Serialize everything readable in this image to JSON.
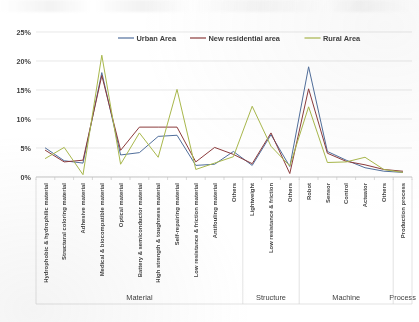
{
  "chart_data": {
    "type": "line",
    "title": "",
    "xlabel": "",
    "ylabel": "",
    "ylim": [
      0,
      25
    ],
    "ytick_labels": [
      "0%",
      "5%",
      "10%",
      "15%",
      "20%",
      "25%"
    ],
    "ytick_values": [
      0,
      5,
      10,
      15,
      20,
      25
    ],
    "grid": true,
    "legend_position": "top-center",
    "categories": [
      "Hydrophobic & hydrophilic material",
      "Structural coloring material",
      "Adhesive material",
      "Medical & biocompatible material",
      "Optical material",
      "Battery & semiconductor material",
      "High strength & toughness material",
      "Self-repairing material",
      "Low resistance & friction material",
      "Antifouling material",
      "Others",
      "Lightweight",
      "Low resistance & friction",
      "Others",
      "Robot",
      "Sensor",
      "Control",
      "Actuator",
      "Others",
      "Production process"
    ],
    "groups": [
      {
        "label": "Material",
        "start": 0,
        "end": 10
      },
      {
        "label": "Structure",
        "start": 11,
        "end": 13
      },
      {
        "label": "Machine",
        "start": 14,
        "end": 18
      },
      {
        "label": "Process",
        "start": 19,
        "end": 19
      }
    ],
    "series": [
      {
        "name": "Urban Area",
        "color": "#516f9c",
        "values": [
          5.0,
          2.8,
          2.4,
          18.0,
          3.8,
          4.2,
          7.0,
          7.2,
          2.0,
          2.2,
          4.4,
          2.0,
          7.3,
          1.8,
          19.0,
          4.4,
          2.9,
          1.6,
          1.0,
          0.8
        ]
      },
      {
        "name": "New residential area",
        "color": "#8c3b3c",
        "values": [
          4.6,
          2.6,
          2.9,
          17.5,
          4.6,
          8.6,
          8.6,
          8.6,
          2.6,
          5.1,
          3.9,
          2.3,
          7.6,
          0.6,
          15.2,
          4.1,
          2.7,
          2.1,
          1.3,
          1.0
        ]
      },
      {
        "name": "Rural Area",
        "color": "#a9b84c",
        "values": [
          3.2,
          5.1,
          0.4,
          21.0,
          2.2,
          7.6,
          3.4,
          15.1,
          1.3,
          2.4,
          3.5,
          12.2,
          5.3,
          1.9,
          12.1,
          2.5,
          2.6,
          3.4,
          1.3,
          0.8
        ]
      }
    ]
  },
  "legend": {
    "items": [
      {
        "label": "Urban Area",
        "color": "#516f9c"
      },
      {
        "label": "New residential area",
        "color": "#8c3b3c"
      },
      {
        "label": "Rural Area",
        "color": "#a9b84c"
      }
    ]
  }
}
